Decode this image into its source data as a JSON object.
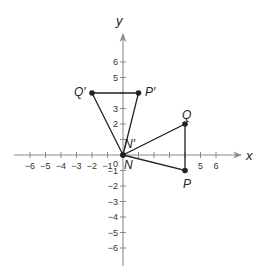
{
  "diagram": {
    "type": "coordinate-plane",
    "title": "",
    "axes": {
      "x_label": "x",
      "y_label": "y",
      "origin_label": "0",
      "x_ticks": [
        -6,
        -5,
        -4,
        -3,
        -2,
        -1,
        1,
        2,
        3,
        4,
        5,
        6
      ],
      "x_tick_labels": [
        "−6",
        "−5",
        "−4",
        "−3",
        "−2",
        "−1",
        "5",
        "6"
      ],
      "x_labeled_values": [
        -6,
        -5,
        -4,
        -3,
        -2,
        -1,
        5,
        6
      ],
      "y_ticks": [
        -6,
        -5,
        -4,
        -3,
        -2,
        -1,
        1,
        2,
        3,
        4,
        5,
        6
      ],
      "y_tick_labels": [
        "6",
        "5",
        "3",
        "2",
        "−1",
        "−2",
        "−3",
        "−4",
        "−5",
        "−6"
      ],
      "y_labeled_values": [
        6,
        5,
        3,
        2,
        -1,
        -2,
        -3,
        -4,
        -5,
        -6
      ],
      "range": {
        "x": [
          -6,
          6
        ],
        "y": [
          -6,
          6
        ]
      },
      "color": "#8a8a8a"
    },
    "points": [
      {
        "name": "N",
        "label": "N",
        "x": 0,
        "y": 0
      },
      {
        "name": "P",
        "label": "P",
        "x": 4,
        "y": -1
      },
      {
        "name": "Q",
        "label": "Q",
        "x": 4,
        "y": 2
      },
      {
        "name": "N'",
        "label": "N′",
        "x": 0,
        "y": 0
      },
      {
        "name": "P'",
        "label": "P′",
        "x": 1,
        "y": 4
      },
      {
        "name": "Q'",
        "label": "Q′",
        "x": -2,
        "y": 4
      }
    ],
    "polygons": [
      {
        "name": "triangle-NPQ",
        "vertices": [
          "N",
          "P",
          "Q"
        ]
      },
      {
        "name": "triangle-N'P'Q'",
        "vertices": [
          "N'",
          "P'",
          "Q'"
        ]
      }
    ],
    "line_color": "#222222"
  }
}
